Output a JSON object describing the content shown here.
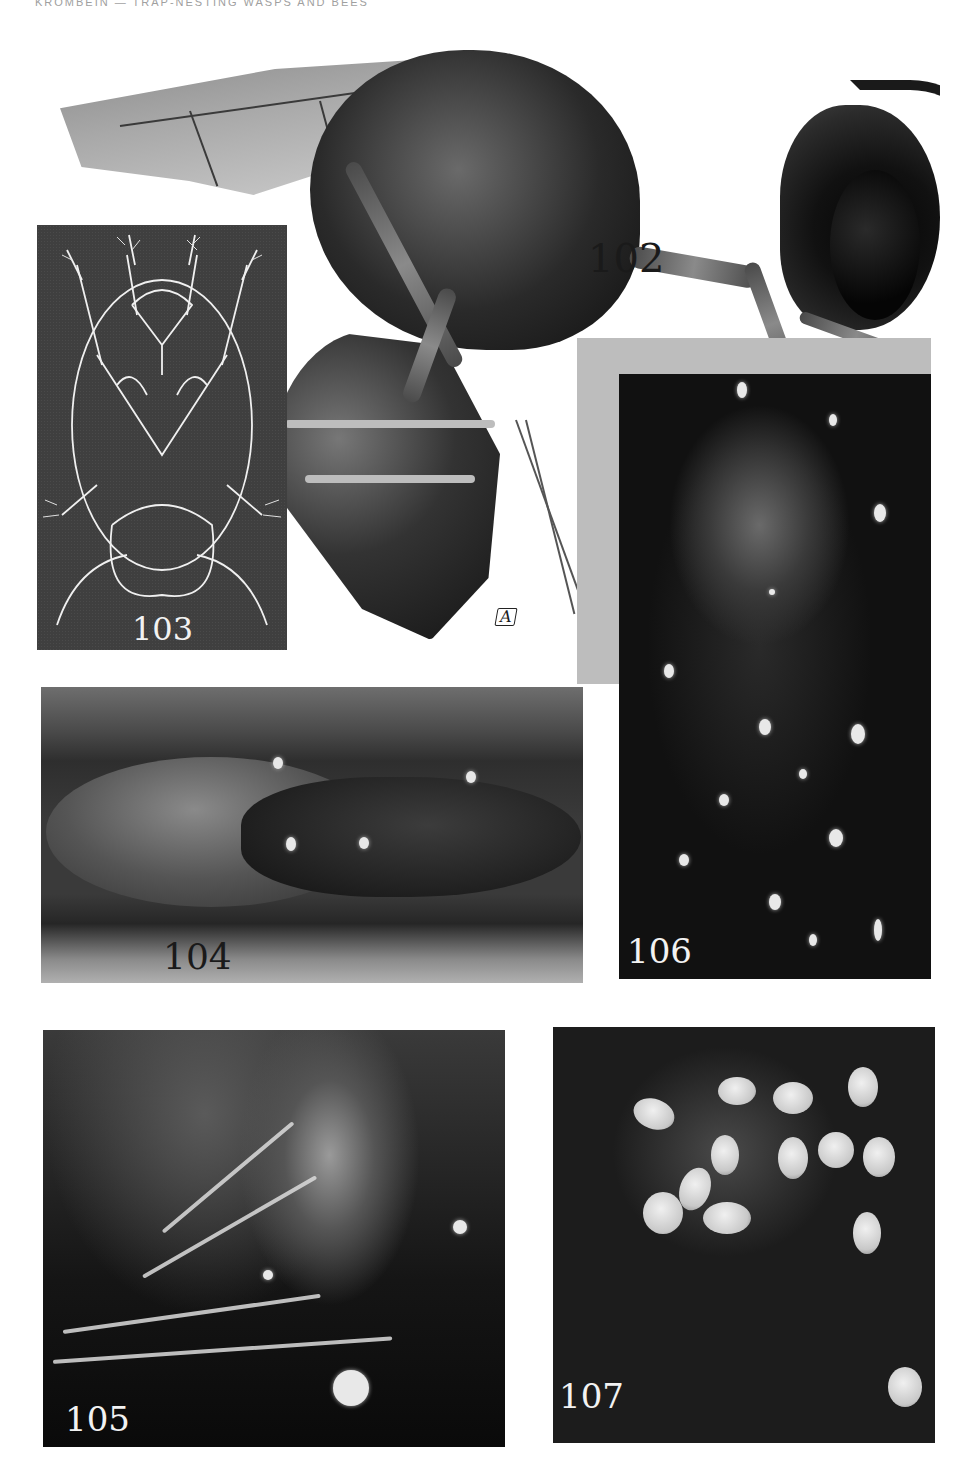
{
  "page": {
    "running_header": "KROMBEIN — TRAP-NESTING WASPS AND BEES"
  },
  "plate": {
    "figures": [
      {
        "id": "102",
        "label": "102",
        "type": "illustration",
        "subject": "wasp lateral view"
      },
      {
        "id": "103",
        "label": "103",
        "type": "line drawing",
        "subject": "mite ventral view"
      },
      {
        "id": "104",
        "label": "104",
        "type": "photograph",
        "subject": "pupae in nest cell"
      },
      {
        "id": "105",
        "label": "105",
        "type": "photograph",
        "subject": "close-up of pupa with mites"
      },
      {
        "id": "106",
        "label": "106",
        "type": "photograph",
        "subject": "pupa with mites, ventral"
      },
      {
        "id": "107",
        "label": "107",
        "type": "photograph",
        "subject": "cluster of mites on pupa"
      }
    ],
    "artist_mark": "A"
  }
}
